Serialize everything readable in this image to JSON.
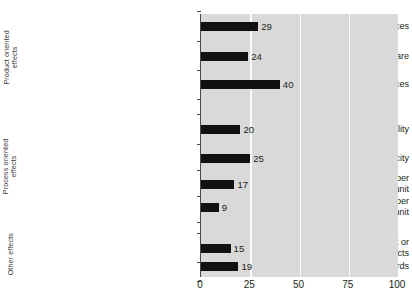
{
  "chart_data": {
    "type": "bar",
    "orientation": "horizontal",
    "title": "",
    "xlabel": "",
    "ylabel": "",
    "xlim": [
      0,
      100
    ],
    "xticks": [
      "0",
      "25",
      "50",
      "75",
      "100"
    ],
    "xtick_values": [
      0,
      25,
      50,
      75,
      100
    ],
    "grid": "vertical white gridlines at 25, 50, 75",
    "legend": "none",
    "plot_background": "#d9d9d9",
    "bar_color": "#111111",
    "groups": [
      {
        "name": "Product oriented effects",
        "label_line1": "Product oriented",
        "label_line2": "effects",
        "items": [
          {
            "label_line1": "Increased range of goods and services",
            "label_line2": "",
            "value": 29
          },
          {
            "label_line1": "Increased market or market share",
            "label_line2": "",
            "value": 24
          },
          {
            "label_line1": "Improved quality of goods and services",
            "label_line2": "",
            "value": 40
          }
        ]
      },
      {
        "name": "Process oriented effects",
        "label_line1": "Process oriented",
        "label_line2": "effects",
        "items": [
          {
            "label_line1": "Increased production flexibility",
            "label_line2": "",
            "value": 20
          },
          {
            "label_line1": "Increased production capacity",
            "label_line2": "",
            "value": 25
          },
          {
            "label_line1": "Reduced labour costs per",
            "label_line2": "produced unit",
            "value": 17
          },
          {
            "label_line1": "Reduced materials and energy per",
            "label_line2": "produced unit",
            "value": 9
          }
        ]
      },
      {
        "name": "Other effects",
        "label_line1": "Other effects",
        "label_line2": "",
        "items": [
          {
            "label_line1": "Improved environmental impact or",
            "label_line2": "health and safety aspects",
            "value": 15
          },
          {
            "label_line1": "Met regulations or standards",
            "label_line2": "",
            "value": 19
          }
        ]
      }
    ],
    "categories": [
      "Increased range of goods and services",
      "Increased market or market share",
      "Improved quality of goods and services",
      "Increased production flexibility",
      "Increased production capacity",
      "Reduced labour costs per produced unit",
      "Reduced materials and energy per produced unit",
      "Improved environmental impact or health and safety aspects",
      "Met regulations or standards"
    ],
    "values": [
      29,
      24,
      40,
      20,
      25,
      17,
      9,
      15,
      19
    ],
    "value_labels": [
      "29",
      "24",
      "40",
      "20",
      "25",
      "17",
      "9",
      "15",
      "19"
    ]
  }
}
